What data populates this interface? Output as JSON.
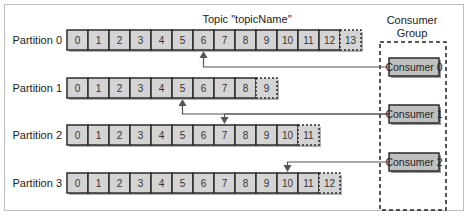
{
  "topic": {
    "title": "Topic \"topicName\""
  },
  "consumer_group": {
    "title_line1": "Consumer",
    "title_line2": "Group"
  },
  "colors": {
    "cell_fill": "#d4d4d4",
    "cell_stroke": "#2b2b2b",
    "consumer_fill": "#bfbfbf",
    "line": "#555555",
    "text": "#222222"
  },
  "partitions": [
    {
      "label": "Partition 0",
      "offsets": [
        "0",
        "1",
        "2",
        "3",
        "4",
        "5",
        "6",
        "7",
        "8",
        "9",
        "10",
        "11",
        "12",
        "13"
      ],
      "next_offset_dashed": "13",
      "consumer_position": "6",
      "consumer": 0
    },
    {
      "label": "Partition 1",
      "offsets": [
        "0",
        "1",
        "2",
        "3",
        "4",
        "5",
        "6",
        "7",
        "8",
        "9"
      ],
      "next_offset_dashed": "9",
      "consumer_position": "5",
      "consumer": 1
    },
    {
      "label": "Partition 2",
      "offsets": [
        "0",
        "1",
        "2",
        "3",
        "4",
        "5",
        "6",
        "7",
        "8",
        "9",
        "10",
        "11"
      ],
      "next_offset_dashed": "11",
      "consumer_position": "7",
      "consumer": 1
    },
    {
      "label": "Partition 3",
      "offsets": [
        "0",
        "1",
        "2",
        "3",
        "4",
        "5",
        "6",
        "7",
        "8",
        "9",
        "10",
        "11",
        "12"
      ],
      "next_offset_dashed": "12",
      "consumer_position": "10",
      "consumer": 2
    }
  ],
  "consumers": [
    {
      "label": "Consumer 0"
    },
    {
      "label": "Consumer 1"
    },
    {
      "label": "Consumer 2"
    }
  ]
}
